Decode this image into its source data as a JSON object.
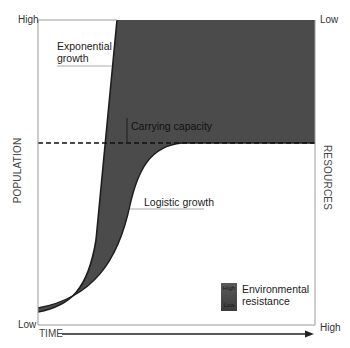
{
  "diagram": {
    "axes": {
      "y_left": {
        "label": "POPULATION",
        "high": "High",
        "low": "Low"
      },
      "y_right": {
        "label": "RESOURCES",
        "high": "High",
        "low": "Low"
      },
      "x": {
        "label": "TIME"
      }
    },
    "annotations": {
      "exponential": "Exponential growth",
      "exponential_line1": "Exponential",
      "exponential_line2": "growth",
      "carrying_capacity": "Carrying capacity",
      "logistic": "Logistic growth"
    },
    "legend": {
      "label_line1": "Environmental",
      "label_line2": "resistance",
      "scale_high": "High",
      "scale_low": "Low"
    },
    "colors": {
      "fill": "#4b4b4b",
      "curve": "#1e1e1e",
      "axis": "#9a9a9a",
      "dashed": "#111111"
    }
  }
}
